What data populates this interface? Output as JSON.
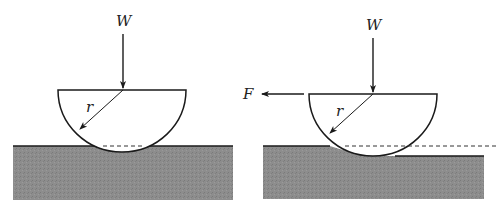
{
  "figure": {
    "left_panel": {
      "load_label": "W",
      "radius_label": "r",
      "state": "static indentation"
    },
    "right_panel": {
      "load_label": "W",
      "force_label": "F",
      "radius_label": "r",
      "state": "sliding with ploughing"
    },
    "colors": {
      "substrate": "#8a8a8a",
      "line": "#1a1a1a",
      "background": "#ffffff"
    }
  }
}
